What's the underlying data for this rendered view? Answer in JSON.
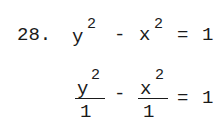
{
  "problem": {
    "number": "28.",
    "line1": {
      "term1_base": "y",
      "term1_exp": "2",
      "op": "-",
      "term2_base": "x",
      "term2_exp": "2",
      "eq": "=",
      "rhs": "1"
    },
    "line2": {
      "frac1_num_base": "y",
      "frac1_num_exp": "2",
      "frac1_den": "1",
      "op": "-",
      "frac2_num_base": "x",
      "frac2_num_exp": "2",
      "frac2_den": "1",
      "eq": "=",
      "rhs": "1"
    }
  }
}
